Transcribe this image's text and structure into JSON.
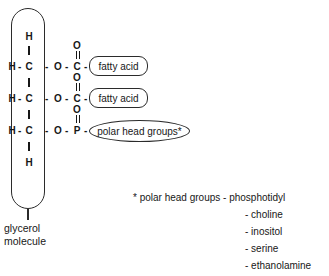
{
  "diagram": {
    "backbone_label": {
      "line1": "glycerol",
      "line2": "molecule"
    },
    "atoms": {
      "hydrogen": "H",
      "carbon": "C",
      "oxygen": "O",
      "phosphorus": "P",
      "bond_dash": "-"
    },
    "rows": [
      {
        "id": "row-1",
        "left_h": "H",
        "dash_1": "-",
        "carbon": "C",
        "dash_2": "-",
        "ester_o": "O",
        "dash_3": "-",
        "center": "C",
        "dash_4": "-",
        "double_bond_o": "O",
        "group_label": "fatty acid"
      },
      {
        "id": "row-2",
        "left_h": "H",
        "dash_1": "-",
        "carbon": "C",
        "dash_2": "-",
        "ester_o": "O",
        "dash_3": "-",
        "center": "C",
        "dash_4": "-",
        "double_bond_o": "O",
        "group_label": "fatty acid"
      },
      {
        "id": "row-3",
        "left_h": "H",
        "dash_1": "-",
        "carbon": "C",
        "dash_2": "-",
        "ester_o": "O",
        "dash_3": "-",
        "center": "P",
        "dash_4": "-",
        "double_bond_o": "O",
        "group_label": "polar head groups*"
      }
    ],
    "terminal_h_top": "H",
    "terminal_h_bottom": "H"
  },
  "footnote": {
    "heading": "* polar head groups - phosphotidyl",
    "items": [
      "- choline",
      "- inositol",
      "- serine",
      "- ethanolamine"
    ]
  },
  "colors": {
    "ink": "#171717",
    "outline": "#2b2b2b",
    "background": "#ffffff"
  }
}
